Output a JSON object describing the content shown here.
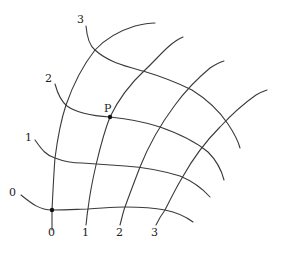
{
  "diagram": {
    "type": "curvilinear coordinate grid",
    "colors": {
      "stroke": "#3a3a3a",
      "text": "#222222",
      "background": "#ffffff"
    },
    "labels": {
      "v0": "0",
      "v1": "1",
      "v2": "2",
      "v3": "3",
      "u0": "0",
      "u1": "1",
      "u2": "2",
      "u3": "3",
      "point_P": "P"
    },
    "v_curves": [
      {
        "name": "v=0",
        "d": "M21,195 C32,204 40,210 52,210 C70,210 80,209 88,209 C105,208 115,207 125,207 C140,207 155,208 165,210 C175,212 185,216 193,222"
      },
      {
        "name": "v=1",
        "d": "M35,140 C42,150 47,156 55,158 C65,162 72,163 82,163 C95,164 110,165 125,166 C140,167 160,170 180,176 C192,181 202,188 210,197"
      },
      {
        "name": "v=2",
        "d": "M55,84 C58,95 62,102 67,106 C78,114 95,116 110,117 C130,119 145,122 160,127 C180,134 196,142 208,152 C216,160 221,168 224,180"
      },
      {
        "name": "v=3",
        "d": "M86,26 C87,38 90,46 95,50 C108,62 125,66 143,71 C163,77 180,84 192,90 C208,100 220,112 228,124 C234,133 238,140 240,148"
      }
    ],
    "u_curves": [
      {
        "name": "u=0",
        "d": "M52,230 C52,222 52,215 52,210 C53,190 54,170 55,158 C58,135 61,120 66,105 C74,82 84,64 95,50 C107,37 122,30 135,26 C143,24 150,23 155,23"
      },
      {
        "name": "u=1",
        "d": "M86,225 C87,218 87,213 88,209 C90,192 93,178 96,165 C100,148 104,132 110,117 C120,96 132,82 145,70 C157,59 170,42 183,37"
      },
      {
        "name": "u=2",
        "d": "M120,225 C122,218 123,212 125,207 C130,193 135,180 140,167 C148,147 160,125 175,105 C186,90 198,78 210,68 C216,64 220,62 224,61"
      },
      {
        "name": "u=3",
        "d": "M156,225 C159,219 162,214 165,210 C170,200 176,188 182,178 C192,160 207,140 220,127 C232,114 246,102 256,95 C261,92 264,91 267,90"
      }
    ],
    "point_P": {
      "x": 110,
      "y": 117
    },
    "origin": {
      "x": 52,
      "y": 210
    }
  }
}
